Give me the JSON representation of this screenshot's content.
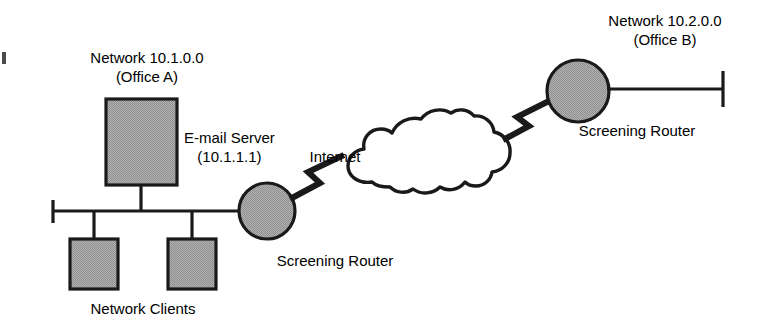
{
  "diagram": {
    "colors": {
      "shape_fill": "#a9a9a9",
      "stroke": "#1a1a1a",
      "text": "#000000",
      "background": "#ffffff"
    },
    "labels": {
      "network_a_line1": "Network 10.1.0.0",
      "network_a_line2": "(Office A)",
      "network_b_line1": "Network 10.2.0.0",
      "network_b_line2": "(Office B)",
      "email_server_line1": "E-mail Server",
      "email_server_line2": "(10.1.1.1)",
      "screening_router_left": "Screening Router",
      "screening_router_right": "Screening Router",
      "internet": "Internet",
      "network_clients": "Network Clients"
    },
    "nodes": [
      {
        "name": "email-server",
        "type": "box",
        "label": "E-mail Server",
        "address": "10.1.1.1",
        "network": "10.1.0.0"
      },
      {
        "name": "network-client-1",
        "type": "box",
        "label": "Network Clients",
        "network": "10.1.0.0"
      },
      {
        "name": "network-client-2",
        "type": "box",
        "label": "Network Clients",
        "network": "10.1.0.0"
      },
      {
        "name": "screening-router-left",
        "type": "circle",
        "label": "Screening Router",
        "network": "10.1.0.0"
      },
      {
        "name": "internet-cloud",
        "type": "cloud",
        "label": "Internet"
      },
      {
        "name": "screening-router-right",
        "type": "circle",
        "label": "Screening Router",
        "network": "10.2.0.0"
      }
    ],
    "links": [
      {
        "name": "bus-office-a",
        "type": "bus",
        "from": "lan-terminator-left",
        "to": "screening-router-left"
      },
      {
        "name": "wan-link-left",
        "type": "lightning",
        "from": "screening-router-left",
        "to": "internet-cloud"
      },
      {
        "name": "wan-link-right",
        "type": "lightning",
        "from": "internet-cloud",
        "to": "screening-router-right"
      },
      {
        "name": "bus-office-b",
        "type": "bus",
        "from": "screening-router-right",
        "to": "lan-terminator-right"
      }
    ]
  }
}
